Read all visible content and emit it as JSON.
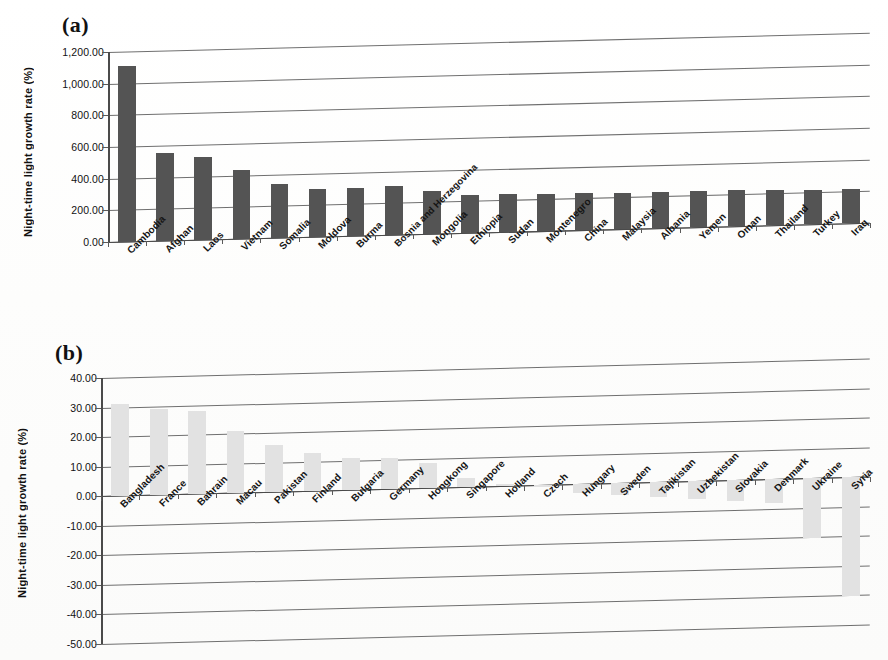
{
  "figure": {
    "panel_a_tag": "(a)",
    "panel_b_tag": "(b)",
    "y_axis_title": "Night-time light growth rate (%)"
  },
  "chart_data": [
    {
      "type": "bar",
      "panel": "(a)",
      "title": "",
      "xlabel": "",
      "ylabel": "Night-time light growth rate (%)",
      "ylim": [
        0,
        1200
      ],
      "ytick_labels": [
        "1,200.00",
        "1,000.00",
        "800.00",
        "600.00",
        "400.00",
        "200.00",
        "0.00"
      ],
      "ytick_values": [
        1200,
        1000,
        800,
        600,
        400,
        200,
        0
      ],
      "grid": true,
      "legend": "none",
      "bar_color": "#545454",
      "categories": [
        "Cambodia",
        "Afghan",
        "Laos",
        "Vietnam",
        "Somalia",
        "Moldova",
        "Burma",
        "Bosnia and Herzegovina",
        "Mongolia",
        "Ethiopia",
        "Sudan",
        "Montenegro",
        "China",
        "Malaysia",
        "Albania",
        "Yemen",
        "Oman",
        "Thailand",
        "Turkey",
        "Iraq"
      ],
      "values": [
        1110,
        555,
        525,
        435,
        340,
        305,
        303,
        308,
        270,
        243,
        240,
        232,
        232,
        231,
        230,
        229,
        230,
        222,
        216,
        216
      ]
    },
    {
      "type": "bar",
      "panel": "(b)",
      "title": "",
      "xlabel": "",
      "ylabel": "Night-time light growth rate (%)",
      "ylim": [
        -50,
        40
      ],
      "ytick_labels": [
        "40.00",
        "30.00",
        "20.00",
        "10.00",
        "0.00",
        "-10.00",
        "-20.00",
        "-30.00",
        "-40.00",
        "-50.00"
      ],
      "ytick_values": [
        40,
        30,
        20,
        10,
        0,
        -10,
        -20,
        -30,
        -40,
        -50
      ],
      "grid": true,
      "legend": "none",
      "bar_color": "#e2e2e2",
      "categories": [
        "Bangladesh",
        "France",
        "Bahrain",
        "Macau",
        "Pakistan",
        "Finland",
        "Bulgaria",
        "Germany",
        "Hongkong",
        "Singapore",
        "Holland",
        "Czech",
        "Hungary",
        "Sweden",
        "Tajikistan",
        "Uzbekistan",
        "Slovakia",
        "Denmark",
        "Ukraine",
        "Syria"
      ],
      "values": [
        31.0,
        29.0,
        28.0,
        21.0,
        16.0,
        13.0,
        11.0,
        10.5,
        8.5,
        3.0,
        0.6,
        -0.6,
        -3.0,
        -4.0,
        -5.0,
        -6.0,
        -7.0,
        -8.0,
        -20.0,
        -40.0
      ]
    }
  ]
}
